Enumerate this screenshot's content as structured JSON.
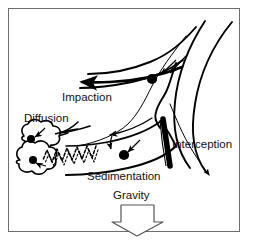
{
  "figure": {
    "title_visible": false,
    "background_color": "#ffffff",
    "ink_color": "#000000",
    "frame": {
      "border_color": "#6e6e6e",
      "border_width_px": 1
    },
    "labels": [
      {
        "id": "impaction",
        "text": "Impaction",
        "x": 62,
        "y": 101
      },
      {
        "id": "diffusion",
        "text": "Diffusion",
        "x": 24,
        "y": 122
      },
      {
        "id": "interception",
        "text": "Interception",
        "x": 172,
        "y": 148
      },
      {
        "id": "sedimentation",
        "text": "Sedimentation",
        "x": 87,
        "y": 180
      },
      {
        "id": "gravity",
        "text": "Gravity",
        "x": 113,
        "y": 199
      }
    ],
    "mechanisms": [
      {
        "name": "Impaction",
        "description": "Particle fails to follow curving airflow at the airway bifurcation and strikes the carina wall."
      },
      {
        "name": "Diffusion",
        "description": "Brownian zigzag motion carries small particles to the alveolar walls."
      },
      {
        "name": "Interception",
        "description": "Elongated fiber contacts the airway wall while following the streamline."
      },
      {
        "name": "Sedimentation",
        "description": "Particle settles onto the airway wall under gravity."
      }
    ],
    "gravity_arrow": {
      "direction": "down",
      "style": "hollow-block-arrow"
    },
    "element_names": {
      "airway_walls": "airway-wall-curves",
      "streamlines": "airflow-streamlines",
      "alveoli": "alveolar-sacs",
      "particles": "deposited-particles",
      "fiber": "elongated-fiber"
    }
  }
}
